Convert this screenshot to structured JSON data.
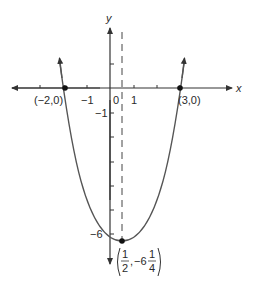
{
  "figure": {
    "function": "y = x^2 - x - 6",
    "x_axis_label": "x",
    "y_axis_label": "y",
    "x_tick_labels": {
      "neg1": "−1",
      "zero": "0",
      "one": "1"
    },
    "y_tick_labels": {
      "neg1": "−1",
      "neg6": "−6"
    },
    "roots": [
      {
        "label": "(−2,0)",
        "x": -2,
        "y": 0
      },
      {
        "label": "(3,0)",
        "x": 3,
        "y": 0
      }
    ],
    "vertex": {
      "x_num": "1",
      "x_den": "2",
      "y_whole": "−6",
      "y_num": "1",
      "y_den": "4",
      "x": 0.5,
      "y": -6.25
    },
    "axis_of_symmetry": "x = 1/2 (dashed)",
    "colors": {
      "curve": "#555555",
      "axis": "#333333",
      "point": "#111111"
    }
  }
}
